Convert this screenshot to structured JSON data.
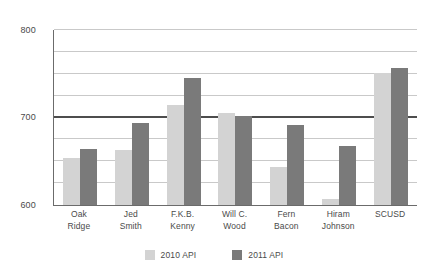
{
  "chart_data": {
    "type": "bar",
    "title": "",
    "subtitle": "",
    "xlabel": "",
    "ylabel": "",
    "ylim": [
      600,
      800
    ],
    "yticks": [
      600,
      700,
      800
    ],
    "ytick_labels": [
      "600",
      "700",
      "800"
    ],
    "gridlines": [
      600,
      625,
      650,
      675,
      700,
      725,
      750,
      775,
      800
    ],
    "grid": true,
    "reference_line": 700,
    "legend_position": "bottom-center",
    "categories": [
      "Oak Ridge",
      "Jed Smith",
      "F.K.B. Kenny",
      "Will C. Wood",
      "Fern Bacon",
      "Hiram Johnson",
      "SCUSD"
    ],
    "category_lines": [
      [
        "Oak",
        "Ridge"
      ],
      [
        "Jed",
        "Smith"
      ],
      [
        "F.K.B.",
        "Kenny"
      ],
      [
        "Will C.",
        "Wood"
      ],
      [
        "Fern",
        "Bacon"
      ],
      [
        "Hiram",
        "Johnson"
      ],
      [
        "SCUSD",
        ""
      ]
    ],
    "series": [
      {
        "name": "2010 API",
        "color": "#d3d3d3",
        "values": [
          654,
          663,
          714,
          705,
          643,
          607,
          751
        ]
      },
      {
        "name": "2011 API",
        "color": "#7a7a7a",
        "values": [
          664,
          694,
          745,
          702,
          691,
          668,
          757
        ]
      }
    ]
  },
  "legend": {
    "items": [
      {
        "label": "2010 API",
        "color": "#d3d3d3"
      },
      {
        "label": "2011 API",
        "color": "#7a7a7a"
      }
    ]
  },
  "axis": {
    "y_top_label": "800",
    "y_mid_label": "700",
    "y_bottom_label": "600"
  }
}
